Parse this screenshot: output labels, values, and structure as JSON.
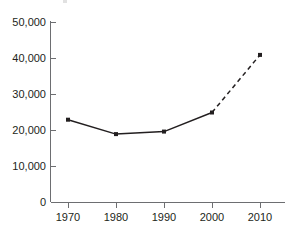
{
  "chart_data": {
    "type": "line",
    "title": "",
    "subtitle": "",
    "xlabel": "",
    "ylabel": "",
    "x": [
      1970,
      1980,
      1990,
      2000,
      2010
    ],
    "categories": [
      "1970",
      "1980",
      "1990",
      "2000",
      "2010"
    ],
    "values": [
      23000,
      19000,
      19700,
      25000,
      41000
    ],
    "series": [
      {
        "name": "",
        "values": [
          23000,
          19000,
          19700,
          25000,
          41000
        ],
        "segment_styles": [
          "solid",
          "solid",
          "solid",
          "dashed"
        ],
        "marker": "square",
        "color": "#231f20"
      }
    ],
    "xlim": [
      1965,
      2015
    ],
    "ylim": [
      0,
      50000
    ],
    "y_ticks": [
      0,
      10000,
      20000,
      30000,
      40000,
      50000
    ],
    "y_tick_labels": [
      "0",
      "10,000",
      "20,000",
      "30,000",
      "40,000",
      "50,000"
    ],
    "x_ticks": [
      1970,
      1980,
      1990,
      2000,
      2010
    ],
    "x_tick_labels": [
      "1970",
      "1980",
      "1990",
      "2000",
      "2010"
    ],
    "grid": false,
    "legend": null,
    "legend_position": "none",
    "annotations": [],
    "colors": {
      "series": "#231f20",
      "axis": "#6d6e71",
      "text": "#231f20",
      "background": "#ffffff"
    }
  },
  "axes": {
    "y_labels": [
      "50,000",
      "40,000",
      "30,000",
      "20,000",
      "10,000",
      "0"
    ],
    "x_labels": [
      "1970",
      "1980",
      "1990",
      "2000",
      "2010"
    ]
  }
}
